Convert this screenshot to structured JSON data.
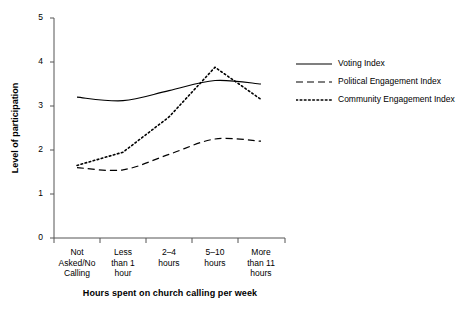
{
  "chart_data": {
    "type": "line",
    "title": "",
    "xlabel": "Hours spent on church calling per week",
    "ylabel": "Level of participation",
    "categories": [
      "Not Asked/No Calling",
      "Less than 1 hour",
      "2–4 hours",
      "5–10 hours",
      "More than 11 hours"
    ],
    "category_lines": [
      [
        "Not",
        "Asked/No",
        "Calling"
      ],
      [
        "Less",
        "than 1",
        "hour"
      ],
      [
        "2–4",
        "hours"
      ],
      [
        "5–10",
        "hours"
      ],
      [
        "More",
        "than 11",
        "hours"
      ]
    ],
    "ylim": [
      0,
      5
    ],
    "yticks": [
      0,
      1,
      2,
      3,
      4,
      5
    ],
    "ytick_labels": [
      "0",
      "1",
      "2",
      "3",
      "4",
      "5"
    ],
    "grid": false,
    "legend_position": "right",
    "series": [
      {
        "name": "Voting Index",
        "style": "solid",
        "color": "#000000",
        "values": [
          3.2,
          3.12,
          3.35,
          3.58,
          3.5
        ]
      },
      {
        "name": "Political Engagement Index",
        "style": "dashed",
        "color": "#000000",
        "values": [
          1.6,
          1.55,
          1.9,
          2.25,
          2.2
        ]
      },
      {
        "name": "Community Engagement Index",
        "style": "dotted",
        "color": "#000000",
        "values": [
          1.65,
          1.95,
          2.75,
          3.88,
          3.15
        ]
      }
    ]
  },
  "legend": {
    "entries": [
      {
        "label": "Voting Index"
      },
      {
        "label": "Political Engagement Index"
      },
      {
        "label": "Community Engagement Index"
      }
    ]
  },
  "axes": {
    "x_title": "Hours spent on church calling per week",
    "y_title": "Level of participation"
  }
}
